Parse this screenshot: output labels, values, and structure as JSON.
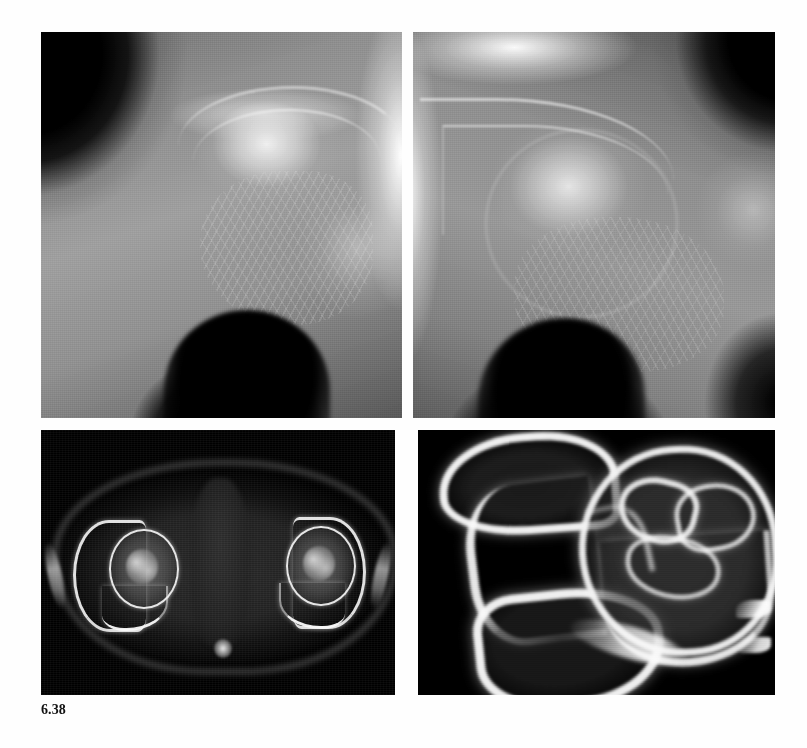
{
  "figure": {
    "caption_label": "6.38",
    "modality_overview": "Radiographs and computed tomography of the hip joints",
    "background_color": "#ffffff",
    "page_width": 807,
    "page_height": 748
  },
  "panels": [
    {
      "id": "top-left",
      "position": "top-left",
      "name": "ap-radiograph-right-hip",
      "modality": "Plain radiograph",
      "view": "AP coned view of hip",
      "description": "Coned anteroposterior radiograph of the hip showing the femoral head, acetabulum and proximal femur with flattening and sclerosis of the superior femoral head",
      "frame_color": "#000000",
      "x": 41,
      "y": 32,
      "width": 361,
      "height": 386
    },
    {
      "id": "top-right",
      "position": "top-right",
      "name": "ap-radiograph-left-hip",
      "modality": "Plain radiograph",
      "view": "AP coned view of contralateral hip",
      "description": "Coned anteroposterior radiograph of the opposite hip showing subchondral lucency and crescent sign of the femoral head",
      "frame_color": "#000000",
      "x": 413,
      "y": 32,
      "width": 362,
      "height": 386
    },
    {
      "id": "bottom-left",
      "position": "bottom-left",
      "name": "axial-ct-pelvis",
      "modality": "Computed tomography",
      "view": "Axial section through both hip joints",
      "description": "Axial CT of the pelvis at the level of the femoral heads showing both acetabula, femoral heads with mottled sclerosis, pubic rami and surrounding soft tissues",
      "frame_color": "#000000",
      "x": 41,
      "y": 430,
      "width": 354,
      "height": 265
    },
    {
      "id": "bottom-right",
      "position": "bottom-right",
      "name": "magnified-ct-hip",
      "modality": "Computed tomography",
      "view": "Magnified axial section of a single hip",
      "description": "Targeted magnified CT of one hip demonstrating the acetabulum, ischium and a femoral head containing serpiginous sclerotic margins and low-density necrotic segments",
      "frame_color": "#000000",
      "x": 418,
      "y": 430,
      "width": 357,
      "height": 265
    }
  ],
  "anatomy_labels": {
    "femoral_head": "femoral head",
    "acetabulum": "acetabulum",
    "iliac_bone": "iliac bone",
    "ischium": "ischium",
    "pubic_ramus": "pubic ramus",
    "obturator_foramen": "obturator foramen",
    "greater_trochanter": "greater trochanter",
    "femoral_neck": "femoral neck",
    "joint_space": "hip joint space",
    "coccyx": "coccyx",
    "soft_tissue": "soft tissue"
  }
}
